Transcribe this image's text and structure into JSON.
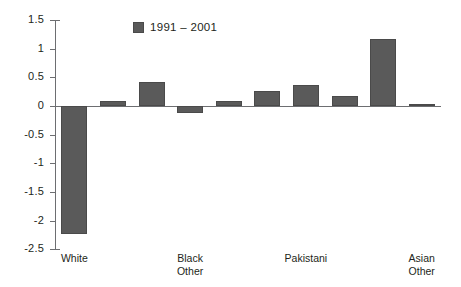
{
  "chart_data": {
    "type": "bar",
    "title": "",
    "subtitle": "",
    "xlabel": "",
    "ylabel": "",
    "ylim": [
      -2.5,
      1.5
    ],
    "ytick_labels": [
      "1.5",
      "1",
      "0.5",
      "0",
      "-0.5",
      "-1",
      "-1.5",
      "-2",
      "-2.5"
    ],
    "ytick_values": [
      1.5,
      1,
      0.5,
      0,
      -0.5,
      -1,
      -1.5,
      -2,
      -2.5
    ],
    "grid": false,
    "legend_position": "top-center",
    "legend": [
      "1991 – 2001"
    ],
    "series": [
      {
        "name": "1991 – 2001",
        "color": "#5a5a5a",
        "values": [
          -2.23,
          0.08,
          0.42,
          -0.13,
          0.08,
          0.27,
          0.37,
          0.17,
          1.17,
          0.04
        ]
      }
    ],
    "categories": [
      "White",
      "",
      "",
      "Black\nOther",
      "",
      "",
      "Pakistani",
      "",
      "",
      "Asian\nOther"
    ],
    "visible_category_labels": [
      {
        "index": 0,
        "text": "White"
      },
      {
        "index": 3,
        "text": "Black\nOther"
      },
      {
        "index": 6,
        "text": "Pakistani"
      },
      {
        "index": 9,
        "text": "Asian\nOther"
      }
    ]
  },
  "legend": {
    "swatch_color": "#5a5a5a",
    "label": "1991 – 2001"
  },
  "axis": {
    "ticks": [
      {
        "label": "1.5",
        "value": 1.5
      },
      {
        "label": "1",
        "value": 1
      },
      {
        "label": "0.5",
        "value": 0.5
      },
      {
        "label": "0",
        "value": 0
      },
      {
        "label": "-0.5",
        "value": -0.5
      },
      {
        "label": "-1",
        "value": -1
      },
      {
        "label": "-1.5",
        "value": -1.5
      },
      {
        "label": "-2",
        "value": -2
      },
      {
        "label": "-2.5",
        "value": -2.5
      }
    ]
  },
  "bars": [
    {
      "label": "White",
      "value": -2.23
    },
    {
      "label": "",
      "value": 0.08
    },
    {
      "label": "",
      "value": 0.42
    },
    {
      "label": "Black\nOther",
      "value": -0.13
    },
    {
      "label": "",
      "value": 0.08
    },
    {
      "label": "",
      "value": 0.27
    },
    {
      "label": "Pakistani",
      "value": 0.37
    },
    {
      "label": "",
      "value": 0.17
    },
    {
      "label": "",
      "value": 1.17
    },
    {
      "label": "Asian\nOther",
      "value": 0.04
    }
  ]
}
